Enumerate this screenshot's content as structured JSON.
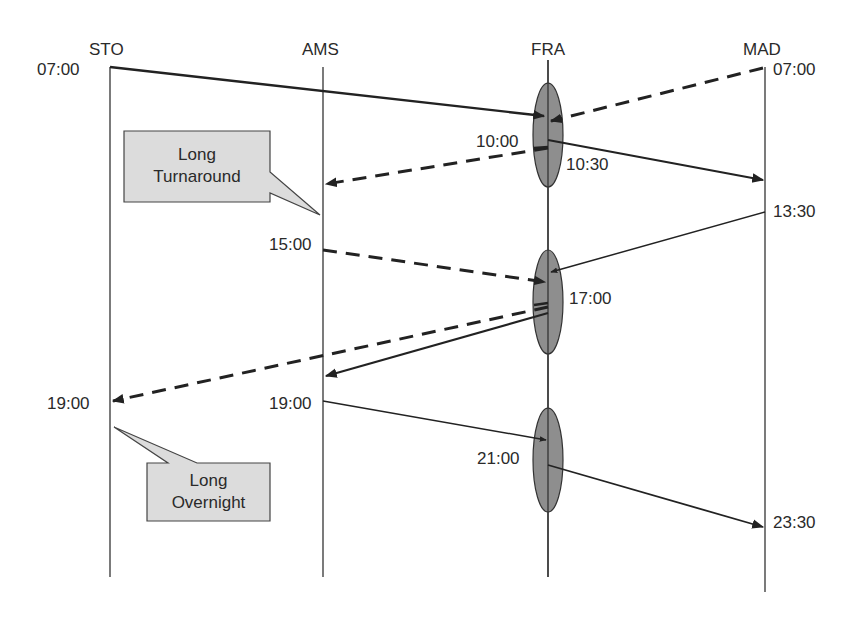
{
  "stations": [
    {
      "code": "STO",
      "x": 110
    },
    {
      "code": "AMS",
      "x": 323
    },
    {
      "code": "FRA",
      "x": 548
    },
    {
      "code": "MAD",
      "x": 765
    }
  ],
  "times": {
    "sto_0700": "07:00",
    "mad_0700": "07:00",
    "fra_1000": "10:00",
    "fra_1030": "10:30",
    "mad_1330": "13:30",
    "ams_1500": "15:00",
    "fra_1700": "17:00",
    "sto_1900": "19:00",
    "ams_1900": "19:00",
    "fra_2100": "21:00",
    "mad_2330": "23:30"
  },
  "callouts": {
    "turnaround": {
      "line1": "Long",
      "line2": "Turnaround"
    },
    "overnight": {
      "line1": "Long",
      "line2": "Overnight"
    }
  },
  "hub_banks": [
    {
      "station": "FRA",
      "center_y": 120
    },
    {
      "station": "FRA",
      "center_y": 302
    },
    {
      "station": "FRA",
      "center_y": 460
    }
  ],
  "flights": [
    {
      "from": "STO",
      "dep": "07:00",
      "to": "FRA",
      "style": "solid-thick"
    },
    {
      "from": "MAD",
      "dep": "07:00",
      "to": "FRA",
      "style": "dashed"
    },
    {
      "from": "FRA",
      "dep": "10:00",
      "to": "AMS",
      "style": "dashed"
    },
    {
      "from": "FRA",
      "dep": "10:30",
      "to": "MAD",
      "style": "solid-thick"
    },
    {
      "from": "MAD",
      "dep": "13:30",
      "to": "FRA",
      "style": "solid-thin"
    },
    {
      "from": "AMS",
      "dep": "15:00",
      "to": "FRA",
      "style": "dashed"
    },
    {
      "from": "FRA",
      "dep": "17:00",
      "to": "STO",
      "arr": "19:00",
      "style": "dashed"
    },
    {
      "from": "FRA",
      "dep": "17:00",
      "to": "AMS",
      "style": "solid-thick"
    },
    {
      "from": "AMS",
      "dep": "19:00",
      "to": "FRA",
      "style": "solid-thin"
    },
    {
      "from": "FRA",
      "dep": "21:00",
      "to": "MAD",
      "arr": "23:30",
      "style": "solid-thick"
    }
  ],
  "colors": {
    "line": "#222222",
    "hub_fill": "#8e8e8e",
    "callout_fill": "#dcdcdc"
  }
}
